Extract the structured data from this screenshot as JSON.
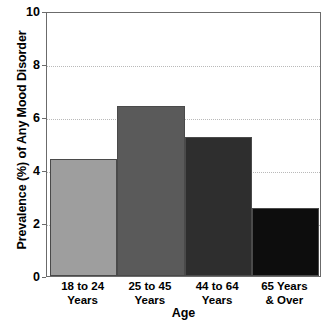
{
  "chart_data": {
    "type": "bar",
    "title": "",
    "xlabel": "Age",
    "ylabel": "Prevalence (%) of Any Mood Disorder",
    "categories": [
      "18 to 24\nYears",
      "25 to 45\nYears",
      "44 to 64\nYears",
      "65 Years\n& Over"
    ],
    "values": [
      4.4,
      6.4,
      5.25,
      2.55
    ],
    "bar_colors": [
      "#9e9e9e",
      "#5a5a5a",
      "#2e2e2e",
      "#0d0d0d"
    ],
    "ylim": [
      0,
      10
    ],
    "yticks": [
      0,
      2,
      4,
      6,
      8,
      10
    ],
    "ytick_labels": [
      "0",
      "2",
      "4",
      "6",
      "8",
      "10"
    ],
    "gridlines": [
      2,
      4,
      6,
      8
    ],
    "grid": true,
    "legend": "none",
    "background": "#ffffff",
    "frame_color": "#6b6b6b"
  },
  "axes": {
    "y_title": "Prevalence (%) of Any Mood Disorder",
    "x_title": "Age"
  }
}
